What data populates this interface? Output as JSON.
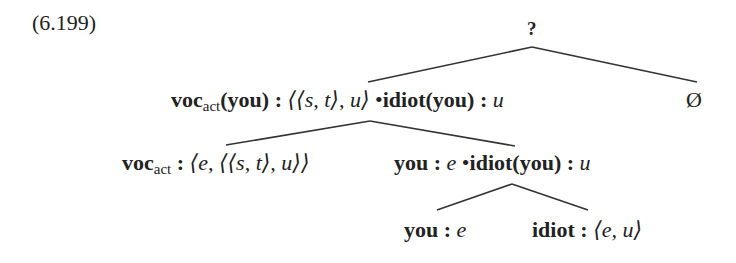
{
  "example_number": "(6.199)",
  "tree": {
    "root": {
      "label": "?"
    },
    "left": {
      "head": "voc",
      "sub": "act",
      "arg": "(you)",
      "sep": " : ",
      "type1": "⟨⟨s, t⟩, u⟩",
      "bullet": "•",
      "term2": "idiot(you)",
      "sep2": " :  ",
      "type2": "u"
    },
    "right": {
      "label": "Ø"
    },
    "left_left": {
      "head": "voc",
      "sub": "act",
      "sep": " : ",
      "type": "⟨e, ⟨⟨s, t⟩, u⟩⟩"
    },
    "left_right": {
      "term": "you",
      "sep": " : ",
      "type": "e",
      "bullet": "•",
      "term2": "idiot(you)",
      "sep2": " :  ",
      "type2": "u"
    },
    "lr_left": {
      "term": "you",
      "sep": " : ",
      "type": "e"
    },
    "lr_right": {
      "term": "idiot",
      "sep": " : ",
      "type": "⟨e, u⟩"
    }
  }
}
